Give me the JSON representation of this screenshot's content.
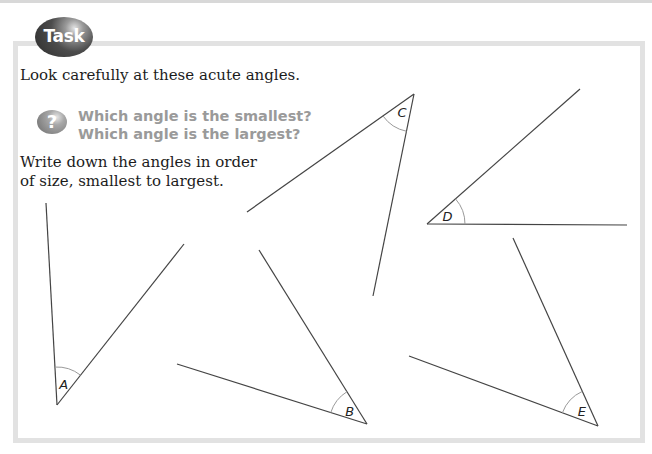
{
  "badge": {
    "label": "Task",
    "icon": "task-badge"
  },
  "intro": "Look carefully at these acute angles.",
  "question": {
    "icon": "question-mark-icon",
    "icon_glyph": "?",
    "lines": [
      "Which angle is the smallest?",
      "Which angle is the largest?"
    ],
    "color": "#9a9a9a"
  },
  "instruction": "Write down the angles in order of size, smallest to largest.",
  "angles": [
    {
      "label": "A",
      "vertex": [
        57,
        405
      ],
      "arm1": [
        46,
        203
      ],
      "arm2": [
        184,
        244
      ]
    },
    {
      "label": "B",
      "vertex": [
        367,
        424
      ],
      "arm1": [
        259,
        250
      ],
      "arm2": [
        177,
        364
      ]
    },
    {
      "label": "C",
      "vertex": [
        414,
        94
      ],
      "arm1": [
        247,
        212
      ],
      "arm2": [
        373,
        296
      ]
    },
    {
      "label": "D",
      "vertex": [
        427,
        224
      ],
      "arm1": [
        580,
        89
      ],
      "arm2": [
        627,
        225
      ]
    },
    {
      "label": "E",
      "vertex": [
        598,
        426
      ],
      "arm1": [
        513,
        238
      ],
      "arm2": [
        409,
        356
      ]
    }
  ],
  "colors": {
    "frame": "#e2e2e2",
    "line": "#444444",
    "arc": "#9a9a9a"
  }
}
